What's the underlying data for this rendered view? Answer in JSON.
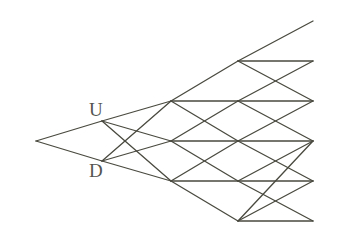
{
  "diagram": {
    "type": "lattice-tree",
    "labels": [
      {
        "id": "U",
        "text": "U",
        "x": 89,
        "y": 116
      },
      {
        "id": "D",
        "text": "D",
        "x": 89,
        "y": 177
      }
    ],
    "nodes": {
      "root": [
        36,
        141
      ],
      "U": [
        102,
        121
      ],
      "D": [
        102,
        161
      ],
      "L2_0": [
        171,
        101
      ],
      "L2_1": [
        171,
        141
      ],
      "L2_2": [
        171,
        181
      ],
      "L3_0": [
        238,
        61
      ],
      "L3_1": [
        238,
        101
      ],
      "L3_2": [
        238,
        141
      ],
      "L3_3": [
        238,
        181
      ],
      "L3_4": [
        238,
        221
      ],
      "L4_0": [
        313,
        21
      ],
      "L4_1": [
        313,
        61
      ],
      "L4_2": [
        313,
        101
      ],
      "L4_3": [
        313,
        141
      ],
      "L4_4": [
        313,
        181
      ],
      "L4_5": [
        313,
        221
      ]
    },
    "edges": [
      [
        "root",
        "U"
      ],
      [
        "root",
        "D"
      ],
      [
        "U",
        "L2_0"
      ],
      [
        "U",
        "L2_1"
      ],
      [
        "U",
        "L2_2"
      ],
      [
        "D",
        "L2_0"
      ],
      [
        "D",
        "L2_1"
      ],
      [
        "D",
        "L2_2"
      ],
      [
        "L2_0",
        "L3_0"
      ],
      [
        "L2_0",
        "L3_1"
      ],
      [
        "L2_0",
        "L3_2"
      ],
      [
        "L2_1",
        "L3_1"
      ],
      [
        "L2_1",
        "L3_2"
      ],
      [
        "L2_1",
        "L3_3"
      ],
      [
        "L2_2",
        "L3_2"
      ],
      [
        "L2_2",
        "L3_3"
      ],
      [
        "L2_2",
        "L3_4"
      ],
      [
        "L3_0",
        "L4_0"
      ],
      [
        "L3_0",
        "L4_1"
      ],
      [
        "L3_0",
        "L4_2"
      ],
      [
        "L3_1",
        "L4_1"
      ],
      [
        "L3_1",
        "L4_2"
      ],
      [
        "L3_1",
        "L4_3"
      ],
      [
        "L3_2",
        "L4_2"
      ],
      [
        "L3_2",
        "L4_3"
      ],
      [
        "L3_2",
        "L4_4"
      ],
      [
        "L3_3",
        "L4_3"
      ],
      [
        "L3_3",
        "L4_4"
      ],
      [
        "L3_3",
        "L4_5"
      ],
      [
        "L3_4",
        "L4_3"
      ],
      [
        "L3_4",
        "L4_4"
      ],
      [
        "L3_4",
        "L4_5"
      ]
    ]
  },
  "colors": {
    "line": "#4a4a40",
    "label": "#555550",
    "background": "#ffffff"
  }
}
